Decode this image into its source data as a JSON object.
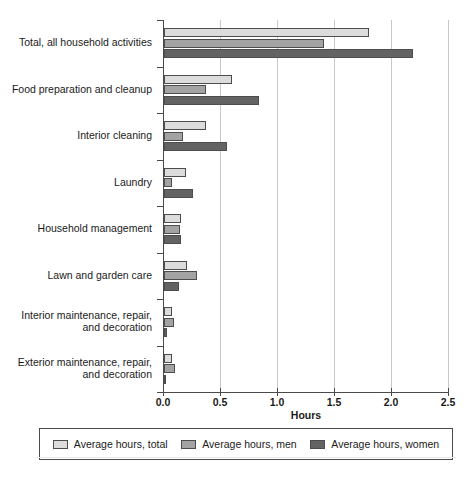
{
  "chart_data": {
    "type": "bar",
    "orientation": "horizontal",
    "title": "",
    "xlabel": "Hours",
    "ylabel": "",
    "xlim": [
      0.0,
      2.5
    ],
    "xticks": [
      "0.0",
      "0.5",
      "1.0",
      "1.5",
      "2.0",
      "2.5"
    ],
    "xtick_values": [
      0.0,
      0.5,
      1.0,
      1.5,
      2.0,
      2.5
    ],
    "grid": "vertical",
    "legend_position": "bottom",
    "categories": [
      "Total, all household activities",
      "Food preparation and cleanup",
      "Interior cleaning",
      "Laundry",
      "Household management",
      "Lawn and garden care",
      "Interior maintenance, repair,\nand decoration",
      "Exterior maintenance, repair,\nand decoration"
    ],
    "series": [
      {
        "name": "Average hours, total",
        "color": "#dcdcdc",
        "values": [
          1.8,
          0.6,
          0.37,
          0.19,
          0.15,
          0.2,
          0.07,
          0.07
        ]
      },
      {
        "name": "Average hours, men",
        "color": "#a3a3a3",
        "values": [
          1.4,
          0.37,
          0.17,
          0.07,
          0.14,
          0.29,
          0.09,
          0.1
        ]
      },
      {
        "name": "Average hours, women",
        "color": "#636363",
        "values": [
          2.18,
          0.83,
          0.55,
          0.25,
          0.15,
          0.13,
          0.03,
          0.02
        ]
      }
    ]
  },
  "axis": {
    "x_title": "Hours"
  },
  "legend": {
    "items": [
      {
        "label": "Average hours, total"
      },
      {
        "label": "Average hours, men"
      },
      {
        "label": "Average hours, women"
      }
    ]
  },
  "artifacts": {
    "top_right": "",
    "bottom_left": ""
  }
}
